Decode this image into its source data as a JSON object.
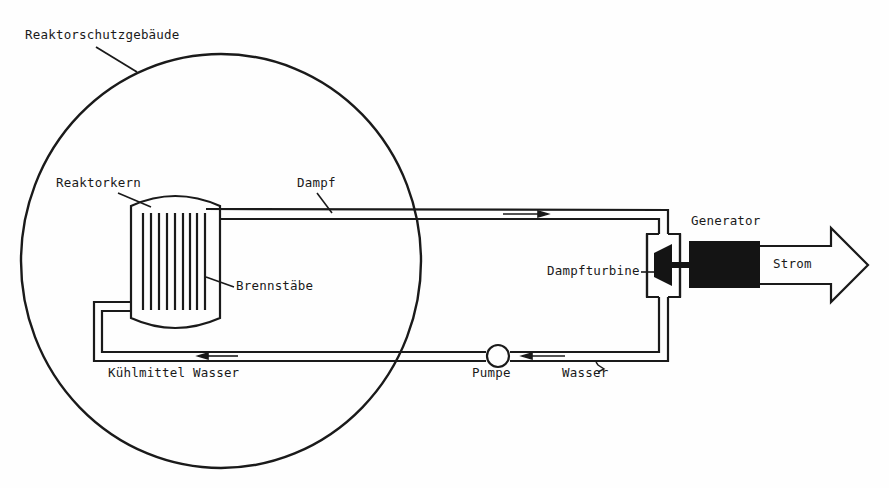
{
  "diagram": {
    "type": "nuclear-power-plant-schematic",
    "colors": {
      "line": "#1a1a1a",
      "fill": "#141414",
      "background": "#fefefe"
    },
    "labels": {
      "containment": "Reaktorschutzgebäude",
      "core": "Reaktorkern",
      "steam": "Dampf",
      "fuel_rods": "Brennstäbe",
      "generator": "Generator",
      "turbine": "Dampfturbine",
      "power": "Strom",
      "coolant": "Kühlmittel Wasser",
      "pump": "Pumpe",
      "water": "Wasser"
    },
    "components": [
      {
        "id": "containment",
        "label": "Reaktorschutzgebäude",
        "shape": "circle"
      },
      {
        "id": "core",
        "label": "Reaktorkern",
        "shape": "vessel"
      },
      {
        "id": "fuel_rods",
        "label": "Brennstäbe",
        "count": 9
      },
      {
        "id": "turbine",
        "label": "Dampfturbine"
      },
      {
        "id": "generator",
        "label": "Generator"
      },
      {
        "id": "pump",
        "label": "Pumpe"
      },
      {
        "id": "output",
        "label": "Strom",
        "shape": "arrow"
      }
    ],
    "flows": [
      {
        "from": "core",
        "to": "turbine",
        "medium": "Dampf",
        "direction": "right"
      },
      {
        "from": "turbine",
        "to": "pump",
        "medium": "Wasser",
        "direction": "left"
      },
      {
        "from": "pump",
        "to": "core",
        "medium": "Kühlmittel Wasser",
        "direction": "left"
      },
      {
        "from": "generator",
        "to": "output",
        "medium": "Strom",
        "direction": "right"
      }
    ]
  }
}
